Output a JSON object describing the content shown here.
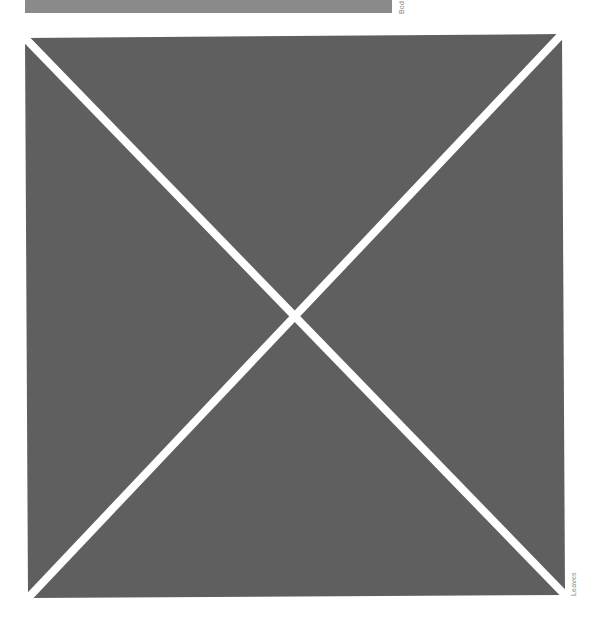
{
  "top_image": {
    "caption": "Bod",
    "fill": "#8a8a8a"
  },
  "main_image": {
    "caption": "Leaves",
    "fill": "#5f5f5f",
    "cross_color": "#ffffff",
    "placeholder_icon": "image-placeholder-x-icon"
  }
}
